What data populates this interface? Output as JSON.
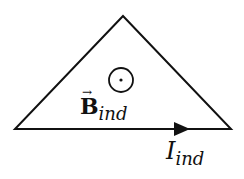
{
  "diagram": {
    "shape": "triangle",
    "stroke_color": "#111111",
    "field_symbol": "out-of-page-dot",
    "field_label": {
      "main": "B",
      "vector_arrow": "→",
      "subscript": "ind"
    },
    "current_label": {
      "main": "I",
      "subscript": "ind"
    },
    "current_direction": "right"
  }
}
